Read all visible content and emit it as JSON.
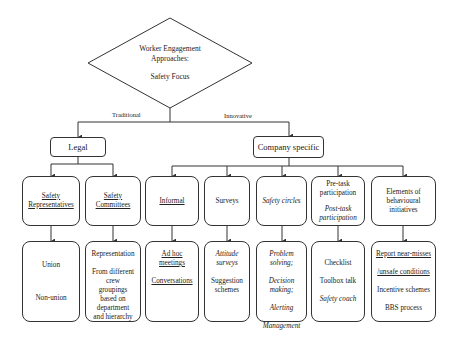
{
  "root": {
    "title_line1": "Worker Engagement",
    "title_line2": "Approaches:",
    "subtitle": "Safety Focus"
  },
  "edges": {
    "left_label": "Traditional",
    "right_label": "Innovative"
  },
  "branches": {
    "legal": {
      "label": "Legal",
      "children": [
        {
          "label_line1": "Safety",
          "label_line2": "Representatives",
          "details": [
            "Union",
            "Non-union"
          ]
        },
        {
          "label_line1": "Safety",
          "label_line2": "Committees",
          "details": [
            "Representation",
            "From different crew groupings based on department and hierarchy"
          ]
        }
      ]
    },
    "company": {
      "label": "Company specific",
      "children": [
        {
          "label": "Informal",
          "details": [
            "Ad hoc meetings",
            "Conversations"
          ]
        },
        {
          "label": "Surveys",
          "details": [
            "Attitude surveys",
            "Suggestion schemes"
          ]
        },
        {
          "label": "Safety circles",
          "details": [
            "Problem solving;",
            "Decision making;",
            "Alerting",
            "Management"
          ]
        },
        {
          "label_line1": "Pre-task participation",
          "label_line2": "Post-task participation",
          "details": [
            "Checklist",
            "Toolbox talk",
            "Safety coach"
          ]
        },
        {
          "label": "Elements of behavioural initiatives",
          "details": [
            "Report near-misses",
            "/unsafe conditions",
            "Incentive schemes",
            "BBS process"
          ]
        }
      ]
    }
  },
  "colors": {
    "line": "#333333",
    "text": "#222222",
    "background": "#ffffff"
  }
}
